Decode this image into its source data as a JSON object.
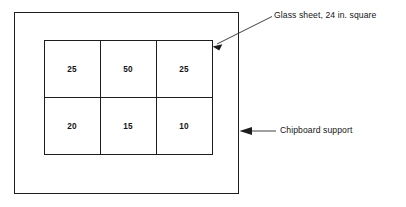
{
  "figure": {
    "background_color": "#ffffff",
    "line_color": "#1d1d1d"
  },
  "callouts": [
    {
      "id": "glass-sheet",
      "label": "Glass sheet, 24 in. square",
      "arrow_direction": "down-left"
    },
    {
      "id": "chipboard-support",
      "label": "Chipboard support",
      "arrow_direction": "left"
    }
  ],
  "grid": {
    "rows": 2,
    "columns": 3,
    "cells": [
      [
        {
          "value": "25"
        },
        {
          "value": "50"
        },
        {
          "value": "25"
        }
      ],
      [
        {
          "value": "20"
        },
        {
          "value": "15"
        },
        {
          "value": "10"
        }
      ]
    ]
  }
}
